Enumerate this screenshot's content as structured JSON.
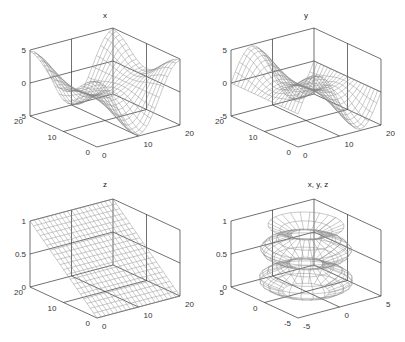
{
  "chart_data": [
    {
      "type": "surface",
      "title": "x",
      "xlabel": "",
      "ylabel": "",
      "zlabel": "",
      "x_ticks": [
        "0",
        "10",
        "20"
      ],
      "y_ticks": [
        "0",
        "10",
        "20"
      ],
      "z_ticks": [
        "-5",
        "0",
        "5"
      ],
      "xlim": [
        0,
        20
      ],
      "ylim": [
        0,
        20
      ],
      "zlim": [
        -5,
        5
      ],
      "grid": true,
      "description": "Wireframe surface, x-component of a parametric surface; two deep valleys and peaks along the diagonal",
      "function": "x"
    },
    {
      "type": "surface",
      "title": "y",
      "xlabel": "",
      "ylabel": "",
      "zlabel": "",
      "x_ticks": [
        "0",
        "10",
        "20"
      ],
      "y_ticks": [
        "0",
        "10",
        "20"
      ],
      "z_ticks": [
        "-5",
        "0",
        "5"
      ],
      "xlim": [
        0,
        20
      ],
      "ylim": [
        0,
        20
      ],
      "zlim": [
        -5,
        5
      ],
      "grid": true,
      "description": "Wireframe surface, y-component of a parametric surface; wavy with two valleys",
      "function": "y"
    },
    {
      "type": "surface",
      "title": "z",
      "xlabel": "",
      "ylabel": "",
      "zlabel": "",
      "x_ticks": [
        "0",
        "10",
        "20"
      ],
      "y_ticks": [
        "0",
        "10",
        "20"
      ],
      "z_ticks": [
        "0",
        "0.5",
        "1"
      ],
      "xlim": [
        0,
        20
      ],
      "ylim": [
        0,
        20
      ],
      "zlim": [
        0,
        1
      ],
      "grid": true,
      "description": "Wireframe plane rising linearly from 0 to 1 along one index",
      "function": "z"
    },
    {
      "type": "surface",
      "title": "x, y, z",
      "xlabel": "",
      "ylabel": "",
      "zlabel": "",
      "x_ticks": [
        "-5",
        "0",
        "5"
      ],
      "y_ticks": [
        "-5",
        "0",
        "5"
      ],
      "z_ticks": [
        "0",
        "0.5",
        "1"
      ],
      "xlim": [
        -5,
        5
      ],
      "ylim": [
        -5,
        5
      ],
      "zlim": [
        0,
        1
      ],
      "grid": true,
      "description": "Parametric surface of revolution: stacked bulging rings with a wide base",
      "function": "xyz"
    }
  ],
  "panels": [
    {
      "title": "x"
    },
    {
      "title": "y"
    },
    {
      "title": "z"
    },
    {
      "title": "x, y, z"
    }
  ]
}
